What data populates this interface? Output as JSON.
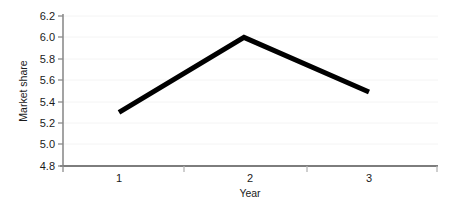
{
  "chart_data": {
    "type": "line",
    "title": "",
    "xlabel": "Year",
    "ylabel": "Market share",
    "categories": [
      "1",
      "2",
      "3"
    ],
    "x": [
      1,
      2,
      3
    ],
    "values": [
      5.3,
      6.0,
      5.49
    ],
    "series": [
      {
        "name": "Market share",
        "values": [
          5.3,
          6.0,
          5.49
        ],
        "color": "#000000",
        "line_width": 5,
        "marker": "none"
      }
    ],
    "xlim": [
      0.5,
      3.5
    ],
    "ylim": [
      4.8,
      6.2
    ],
    "yticks": [
      4.8,
      5.0,
      5.2,
      5.4,
      5.6,
      5.8,
      6.0,
      6.2
    ],
    "ytick_labels": [
      "4.8",
      "5.0",
      "5.2",
      "5.4",
      "5.6",
      "5.8",
      "6.0",
      "6.2"
    ],
    "xticks": [
      1,
      2,
      3
    ],
    "xtick_labels": [
      "1",
      "2",
      "3"
    ],
    "grid": true,
    "grid_axis": "y",
    "grid_color": "#f2f2f2",
    "legend": false,
    "legend_position": "none",
    "background_color": "#ffffff",
    "axis_color": "#808080"
  },
  "axis": {
    "y_labels": {
      "t0": "6.2",
      "t1": "6.0",
      "t2": "5.8",
      "t3": "5.6",
      "t4": "5.4",
      "t5": "5.2",
      "t6": "5.0",
      "t7": "4.8"
    },
    "x_labels": {
      "t0": "1",
      "t1": "2",
      "t2": "3"
    },
    "y_title": "Market share",
    "x_title": "Year"
  }
}
